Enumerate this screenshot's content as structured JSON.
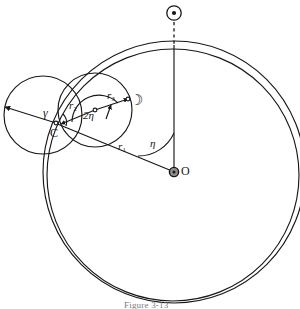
{
  "figure": {
    "caption": "Figure 3-13"
  },
  "symbols": {
    "sun": {
      "name": "sun-symbol",
      "glyph": "☉",
      "description": "Sun"
    },
    "moon": {
      "name": "moon-symbol",
      "glyph": "☽",
      "description": "Moon"
    },
    "earth": {
      "name": "earth-symbol",
      "glyph": "⊕",
      "description": "Earth"
    }
  },
  "labels": {
    "origin": "O",
    "point_c": "C",
    "gamma": "γ",
    "eta": "η",
    "two_eta": "2η",
    "r1_base": "r",
    "r1_sub": "1",
    "r2_base": "r",
    "r2_sub": "2",
    "r3_base": "r",
    "r3_sub": "3"
  },
  "colors": {
    "ink": "#17171a",
    "ink_soft": "#2b2b30",
    "paper": "#ffffff",
    "caption": "#7b7b80",
    "marker_fill": "#8d8d92"
  },
  "geometry": {
    "orbit_outer": {
      "cx": 174,
      "cy": 172,
      "r": 131
    },
    "orbit_inner": {
      "cx": 173,
      "cy": 174,
      "r": 126
    },
    "left_circle": {
      "cx": 43,
      "cy": 115,
      "r": 39
    },
    "lunar_circle": {
      "cx": 95,
      "cy": 110,
      "r": 37
    },
    "point_o": {
      "x": 174,
      "y": 172
    },
    "point_c": {
      "x": 55,
      "y": 123
    },
    "sun_marker": {
      "x": 174,
      "y": 13
    },
    "moon_marker": {
      "x": 136,
      "y": 101
    },
    "eta_value_deg": 38,
    "two_eta_value_deg": 76
  }
}
